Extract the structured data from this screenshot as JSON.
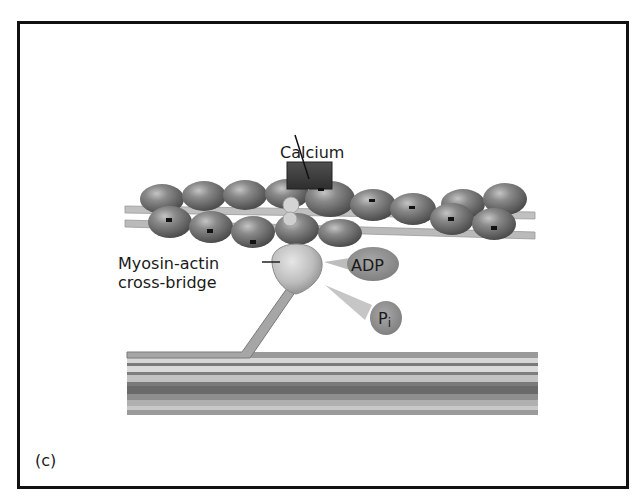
{
  "figure": {
    "panel_label": "(c)",
    "labels": {
      "calcium": "Calcium",
      "crossbridge_line1": "Myosin-actin",
      "crossbridge_line2": "cross-bridge",
      "adp": "ADP",
      "pi_main": "P",
      "pi_sub": "i"
    },
    "colors": {
      "border": "#111111",
      "bead": "#6e6e6e",
      "bead_highlight": "#b5b5b5",
      "filament_rod": "#b8b8b8",
      "myosin_head": "#c8c8c8",
      "calcium_block": "#3c3c3c",
      "molecule_blob": "#8c8c8c",
      "thick_filament_dark": "#6a6a6a",
      "thick_filament_light": "#d0d0d0"
    }
  }
}
